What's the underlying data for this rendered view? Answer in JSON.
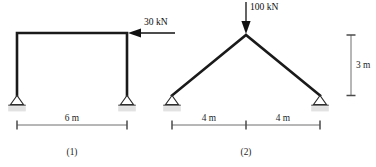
{
  "figure": {
    "background_color": "#ffffff",
    "member_color": "#1a1a1a",
    "dimension_color": "#5d5d5d",
    "support_plate_color": "#e2e2e2",
    "width_px": 376,
    "height_px": 167
  },
  "structures": [
    {
      "id": "structure-1",
      "caption": "(1)",
      "type": "portal-frame",
      "load": {
        "label": "30 kN",
        "magnitude": 30,
        "unit": "kN",
        "direction": "horizontal-leftward",
        "applied_at": "top-right-joint"
      },
      "spans": [
        {
          "label": "6 m",
          "value": 6,
          "unit": "m"
        }
      ],
      "supports": [
        {
          "position": "left-base",
          "type": "pinned"
        },
        {
          "position": "right-base",
          "type": "pinned"
        }
      ]
    },
    {
      "id": "structure-2",
      "caption": "(2)",
      "type": "two-bar-truss",
      "load": {
        "label": "100 kN",
        "magnitude": 100,
        "unit": "kN",
        "direction": "vertical-downward",
        "applied_at": "apex-joint"
      },
      "spans": [
        {
          "label": "4 m",
          "value": 4,
          "unit": "m"
        },
        {
          "label": "4 m",
          "value": 4,
          "unit": "m"
        }
      ],
      "heights": [
        {
          "label": "3 m",
          "value": 3,
          "unit": "m"
        }
      ],
      "supports": [
        {
          "position": "left-base",
          "type": "pinned"
        },
        {
          "position": "right-base",
          "type": "pinned"
        }
      ]
    }
  ],
  "labels": {
    "load_1": "30 kN",
    "load_2": "100 kN",
    "span_1": "6 m",
    "span_2a": "4 m",
    "span_2b": "4 m",
    "height_2": "3 m",
    "caption_1": "(1)",
    "caption_2": "(2)"
  }
}
